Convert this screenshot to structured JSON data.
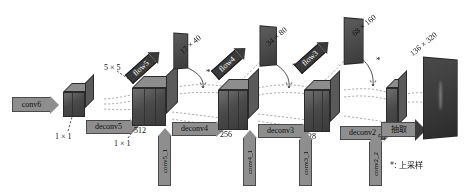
{
  "diagram": {
    "legend": {
      "symbol": "*",
      "text": "*: 上采样"
    },
    "stages": [
      {
        "id": "conv6",
        "input_arrow": "conv6",
        "kernel_top": "1 × 1",
        "channels": ""
      },
      {
        "id": "deconv5",
        "deconv_label": "deconv5",
        "kernel_top": "5 × 5",
        "kernel_bottom": "1 × 1",
        "channels": "512",
        "skip_conv": "conv5_1",
        "flow_label": "flow5",
        "flow_size": "17 × 40"
      },
      {
        "id": "deconv4",
        "deconv_label": "deconv4",
        "channels": "256",
        "skip_conv": "conv4_1",
        "flow_label": "flow4",
        "flow_size": "34 × 80"
      },
      {
        "id": "deconv3",
        "deconv_label": "deconv3",
        "channels": "128",
        "skip_conv": "conv3_1",
        "flow_label": "flow3",
        "flow_size": "68 × 160"
      },
      {
        "id": "deconv2",
        "deconv_label": "deconv2",
        "channels": "64",
        "skip_conv": "conv2_2"
      }
    ],
    "output": {
      "arrow_label": "抽取",
      "size": "136 × 320"
    }
  }
}
